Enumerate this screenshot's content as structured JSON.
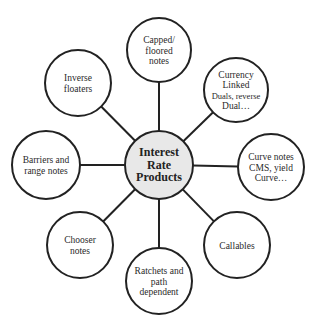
{
  "diagram": {
    "colors": {
      "stroke": "#222222",
      "center_fill": "#e8e8e8",
      "node_fill": "#ffffff",
      "text": "#2a2a2a"
    },
    "center": {
      "id": "interest-rate-products",
      "lines": [
        "Interest",
        "Rate",
        "Products"
      ],
      "cx": 159,
      "cy": 165,
      "r": 34
    },
    "nodes": [
      {
        "id": "capped-floored-notes",
        "lines": [
          "Capped/",
          "floored",
          "notes"
        ],
        "cx": 159,
        "cy": 50,
        "r": 32
      },
      {
        "id": "currency-linked",
        "lines": [
          "Currency",
          "Linked",
          "Duals, reverse",
          "Dual…"
        ],
        "cx": 236,
        "cy": 90,
        "r": 32
      },
      {
        "id": "curve-notes",
        "lines": [
          "Curve notes",
          "CMS, yield",
          "Curve…"
        ],
        "cx": 271,
        "cy": 167,
        "r": 33
      },
      {
        "id": "callables",
        "lines": [
          "Callables"
        ],
        "cx": 237,
        "cy": 245,
        "r": 33
      },
      {
        "id": "ratchets-path-dependent",
        "lines": [
          "Ratchets and",
          "path",
          "dependent"
        ],
        "cx": 159,
        "cy": 281,
        "r": 33
      },
      {
        "id": "chooser-notes",
        "lines": [
          "Chooser",
          "notes"
        ],
        "cx": 80,
        "cy": 245,
        "r": 33
      },
      {
        "id": "barriers-range-notes",
        "lines": [
          "Barriers and",
          "range notes"
        ],
        "cx": 46,
        "cy": 165,
        "r": 34
      },
      {
        "id": "inverse-floaters",
        "lines": [
          "Inverse",
          "floaters"
        ],
        "cx": 78,
        "cy": 83,
        "r": 33
      }
    ]
  }
}
